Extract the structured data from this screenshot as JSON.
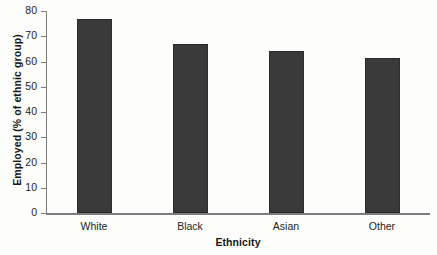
{
  "chart_data": {
    "type": "bar",
    "title": "",
    "subtitle": "",
    "categories": [
      "White",
      "Black",
      "Asian",
      "Other"
    ],
    "values": [
      77,
      67,
      64,
      61.5
    ],
    "xlabel": "Ethnicity",
    "ylabel": "Employed (% of ethnic group)",
    "ylim": [
      0,
      80
    ],
    "ytick_step": 10,
    "yticks": [
      0,
      10,
      20,
      30,
      40,
      50,
      60,
      70,
      80
    ],
    "ytick_labels": [
      "0",
      "10",
      "20",
      "30",
      "40",
      "50",
      "60",
      "70",
      "80"
    ],
    "grid": false,
    "legend": false,
    "legend_position": "none",
    "bar_color": "#3a3a3a",
    "bar_edge_color": "#2b2b2b",
    "axis_color": "#7d7d7d",
    "background_color": "#fdfdfb",
    "text_color": "#232323"
  }
}
